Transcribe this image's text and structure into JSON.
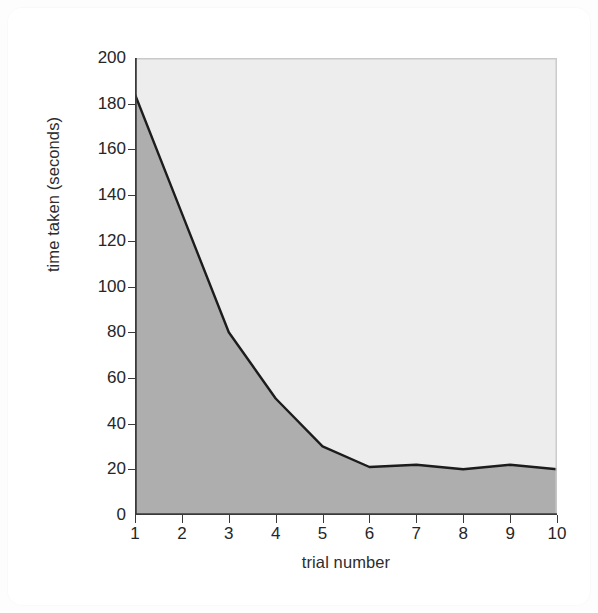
{
  "figure": {
    "background_color": "#ffffff",
    "plot_upper_fill": "#ededed",
    "plot_lower_fill": "#aeaeae",
    "line_color": "#1c1c1c",
    "axis_color": "#3a3a3a",
    "text_color": "#262626"
  },
  "chart_data": {
    "type": "area",
    "title": "",
    "xlabel": "trial number",
    "ylabel": "time taken (seconds)",
    "x": [
      1,
      2,
      3,
      4,
      5,
      6,
      7,
      8,
      9,
      10
    ],
    "values": [
      184,
      132,
      80,
      51,
      30,
      21,
      22,
      20,
      22,
      20
    ],
    "series": [
      {
        "name": "time taken",
        "values": [
          184,
          132,
          80,
          51,
          30,
          21,
          22,
          20,
          22,
          20
        ]
      }
    ],
    "xlim": [
      1,
      10
    ],
    "ylim": [
      0,
      200
    ],
    "xticks": [
      "1",
      "2",
      "3",
      "4",
      "5",
      "6",
      "7",
      "8",
      "9",
      "10"
    ],
    "xtick_values": [
      1,
      2,
      3,
      4,
      5,
      6,
      7,
      8,
      9,
      10
    ],
    "yticks": [
      "0",
      "20",
      "40",
      "60",
      "80",
      "100",
      "120",
      "140",
      "160",
      "180",
      "200"
    ],
    "ytick_values": [
      0,
      20,
      40,
      60,
      80,
      100,
      120,
      140,
      160,
      180,
      200
    ],
    "grid": false,
    "legend": null,
    "fill_below_curve": true,
    "annotations": []
  }
}
